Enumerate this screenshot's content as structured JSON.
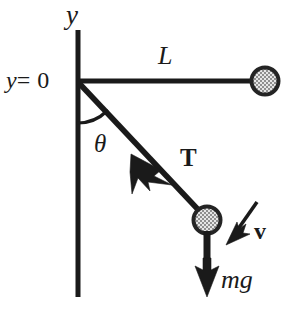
{
  "figure": {
    "background_color": "#ffffff",
    "ink_color": "#1a1a1a",
    "width": 302,
    "height": 316
  },
  "labels": {
    "y_axis": "y",
    "y_zero": "y = 0",
    "y_zero_var": "y",
    "y_zero_rest": "= 0",
    "length": "L",
    "angle": "θ",
    "tension": "T",
    "velocity": "v",
    "weight": "mg"
  },
  "geometry": {
    "origin": {
      "x": 78,
      "y": 81
    },
    "y_axis": {
      "x": 78,
      "y_top": 30,
      "y_bottom": 297,
      "stroke_width": 5
    },
    "horizontal_rod": {
      "x1": 78,
      "y1": 81,
      "x2": 255,
      "y2": 81,
      "stroke_width": 5
    },
    "string": {
      "x1": 78,
      "y1": 82,
      "x2": 205,
      "y2": 216,
      "stroke_width": 5
    },
    "angle_arc": {
      "center_x": 78,
      "center_y": 81,
      "radius": 42,
      "start_deg": 90,
      "end_deg": 46
    },
    "bob_top": {
      "cx": 265,
      "cy": 81,
      "r_outer": 14,
      "r_inner": 10
    },
    "bob_swing": {
      "cx": 207,
      "cy": 220,
      "r_outer": 14,
      "r_inner": 10
    },
    "tension_arrow": {
      "x1": 203,
      "y1": 214,
      "x2": 133,
      "y2": 156
    },
    "weight_arrow": {
      "x1": 207,
      "y1": 231,
      "x2": 207,
      "y2": 296
    },
    "velocity_arrow": {
      "x1": 256,
      "y1": 203,
      "x2": 227,
      "y2": 244
    }
  },
  "colors": {
    "ink": "#1a1a1a",
    "bob_ring": "#242424",
    "bob_fill_light": "#d8d8d8",
    "bob_fill_dark": "#8c8c8c"
  }
}
